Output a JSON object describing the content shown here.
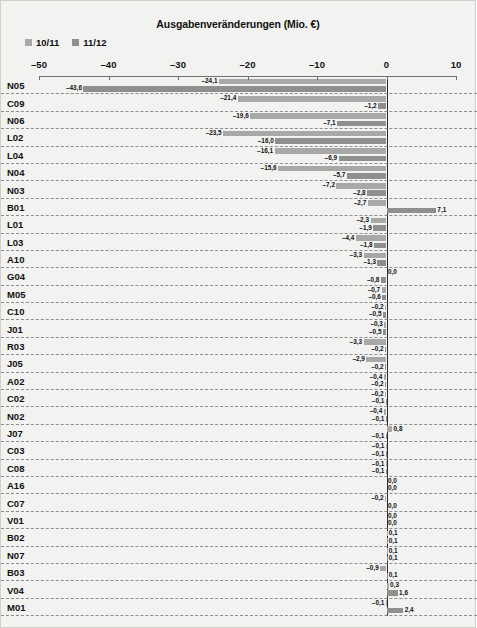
{
  "chart_data": {
    "type": "bar",
    "orientation": "horizontal",
    "title": "Ausgabenveränderungen (Mio. €)",
    "xlabel": "",
    "ylabel": "",
    "xlim": [
      -50,
      10
    ],
    "xticks": [
      -50,
      -40,
      -30,
      -20,
      -10,
      0,
      10
    ],
    "xtick_labels": [
      "–50",
      "–40",
      "–30",
      "–20",
      "–10",
      "0",
      "10"
    ],
    "grid": true,
    "legend_position": "top-left",
    "categories": [
      "N05",
      "C09",
      "N06",
      "L02",
      "L04",
      "N04",
      "N03",
      "B01",
      "L01",
      "L03",
      "A10",
      "G04",
      "M05",
      "C10",
      "J01",
      "R03",
      "J05",
      "A02",
      "C02",
      "N02",
      "J07",
      "C03",
      "C08",
      "A16",
      "C07",
      "V01",
      "B02",
      "N07",
      "B03",
      "V04",
      "M01"
    ],
    "series": [
      {
        "name": "10/11",
        "color": "#a8a8a6",
        "values": [
          -24.1,
          -21.4,
          -19.6,
          -23.5,
          -16.1,
          -15.6,
          -7.2,
          -2.7,
          -2.3,
          -4.4,
          -3.3,
          0.0,
          -0.7,
          -0.2,
          -0.3,
          -3.3,
          -2.9,
          -0.4,
          -0.2,
          -0.4,
          0.8,
          -0.1,
          -0.1,
          0.0,
          -0.2,
          0.0,
          0.1,
          0.1,
          -0.9,
          0.3,
          -0.1
        ],
        "value_labels": [
          "–24,1",
          "–21,4",
          "–19,6",
          "–23,5",
          "–16,1",
          "–15,6",
          "–7,2",
          "–2,7",
          "–2,3",
          "–4,4",
          "–3,3",
          "0,0",
          "–0,7",
          "–0,2",
          "–0,3",
          "–3,3",
          "–2,9",
          "–0,4",
          "–0,2",
          "–0,4",
          "0,8",
          "–0,1",
          "–0,1",
          "0,0",
          "–0,2",
          "0,0",
          "0,1",
          "0,1",
          "–0,9",
          "0,3",
          "–0,1"
        ]
      },
      {
        "name": "11/12",
        "color": "#8f8f8d",
        "values": [
          -43.6,
          -1.2,
          -7.1,
          -16.0,
          -6.9,
          -5.7,
          -2.8,
          7.1,
          -1.9,
          -1.8,
          -1.3,
          -0.8,
          -0.6,
          -0.5,
          -0.5,
          -0.2,
          -0.2,
          -0.2,
          -0.1,
          -0.1,
          -0.1,
          -0.1,
          -0.1,
          0.0,
          0.0,
          0.0,
          0.1,
          0.1,
          0.1,
          1.6,
          2.4
        ],
        "value_labels": [
          "–43,6",
          "–1,2",
          "–7,1",
          "–16,0",
          "–6,9",
          "–5,7",
          "–2,8",
          "7,1",
          "–1,9",
          "–1,8",
          "–1,3",
          "–0,8",
          "–0,6",
          "–0,5",
          "–0,5",
          "–0,2",
          "–0,2",
          "–0,2",
          "–0,1",
          "–0,1",
          "–0,1",
          "–0,1",
          "–0,1",
          "0,0",
          "0,0",
          "0,0",
          "0,1",
          "0,1",
          "0,1",
          "1,6",
          "2,4"
        ]
      }
    ]
  }
}
